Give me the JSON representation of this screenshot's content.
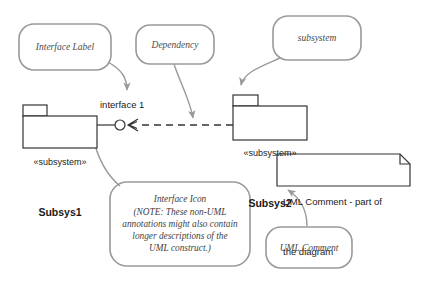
{
  "diagram": {
    "colors": {
      "annotation_stroke": "#9a9a9a",
      "annotation_text": "#4a4a4a",
      "element_stroke": "#333333",
      "element_text": "#1a1a1a",
      "leader_line": "#8c8c8c",
      "background": "#ffffff"
    }
  },
  "annotations": {
    "interface_label": {
      "text": "Interface Label",
      "shape": "rounded-rectangle"
    },
    "dependency": {
      "text": "Dependency",
      "shape": "rounded-rectangle"
    },
    "subsystem": {
      "text": "subsystem",
      "shape": "rounded-rectangle"
    },
    "interface_icon": {
      "line1": "Interface Icon",
      "line2": "(NOTE: These non-UML",
      "line3": "annotations might also contain",
      "line4": "longer descriptions of the",
      "line5": "UML construct.)",
      "shape": "rounded-rectangle"
    },
    "uml_comment": {
      "text": "UML Comment",
      "shape": "rounded-rectangle"
    }
  },
  "elements": {
    "subsys1": {
      "stereotype": "«subsystem»",
      "name": "Subsys1",
      "shape": "package"
    },
    "subsys2": {
      "stereotype": "«subsystem»",
      "name": "Subsys2",
      "shape": "package"
    },
    "interface": {
      "label": "interface 1",
      "shape": "lollipop-socket"
    },
    "note": {
      "line1": "UML Comment - part of",
      "line2": "the diagram",
      "shape": "note-folded-corner"
    },
    "dependency_connector": {
      "style": "dashed-arrow",
      "from": "Subsys2",
      "to": "interface 1"
    }
  }
}
